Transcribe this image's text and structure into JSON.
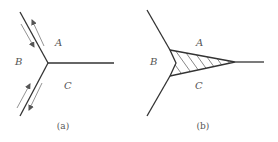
{
  "figure": {
    "panels": [
      {
        "id": "a",
        "caption": "(a)",
        "labels": {
          "A": "A",
          "B": "B",
          "C": "C"
        },
        "description": "Triple junction with three grain boundaries; arrows along the upper and lower boundaries show opposite sliding directions"
      },
      {
        "id": "b",
        "caption": "(b)",
        "labels": {
          "A": "A",
          "B": "B",
          "C": "C"
        },
        "description": "Triple junction after sliding, with a hatched wedge-shaped region (crack) opening between grains A and C"
      }
    ],
    "colors": {
      "line": "#333333",
      "arrow": "#777777",
      "text": "#555555",
      "background": "#ffffff"
    }
  }
}
